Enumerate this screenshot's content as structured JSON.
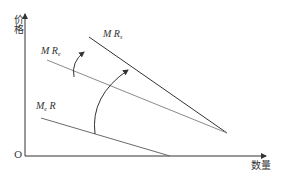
{
  "diagram": {
    "axes": {
      "y_label": "价格",
      "x_label": "数量",
      "origin_label": "O"
    },
    "curves": [
      {
        "id": "mrs",
        "label_main": "M R",
        "label_sub": "s",
        "color": "#333333"
      },
      {
        "id": "mre",
        "label_main": "M R",
        "label_sub": "e",
        "color": "#888888"
      },
      {
        "id": "mer",
        "label_main": "M",
        "label_sub": "e",
        "label_tail": " R",
        "color": "#666666"
      }
    ],
    "arrows": [
      {
        "id": "rotate-small",
        "description": "curved arrow from MR_e toward MR_s"
      },
      {
        "id": "rotate-large",
        "description": "curved arrow from M_eR toward MR_s"
      }
    ]
  },
  "colors": {
    "axis": "#333333",
    "dark_line": "#333333",
    "light_line": "#8a8a8a",
    "background": "#ffffff"
  }
}
